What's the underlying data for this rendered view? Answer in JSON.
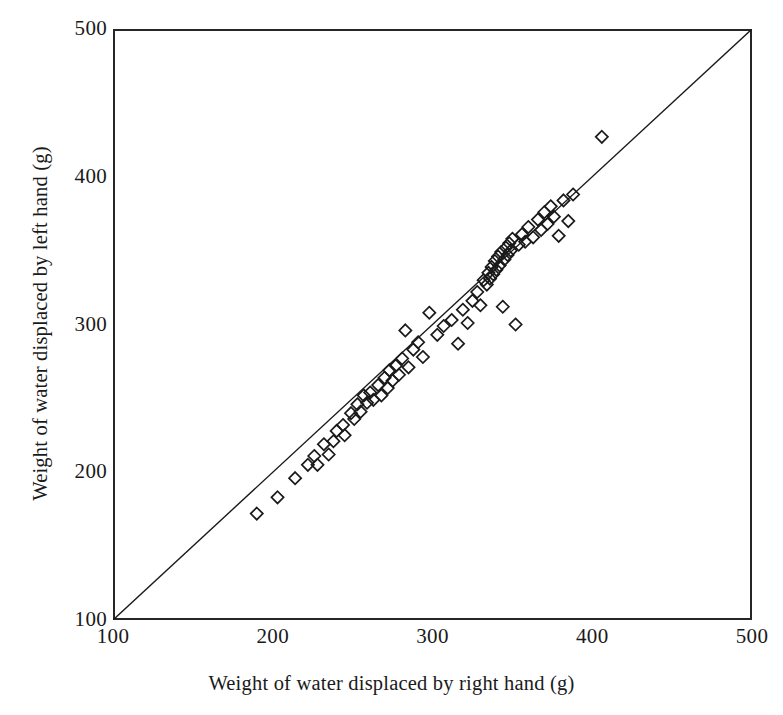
{
  "figure": {
    "background_color": "#ffffff",
    "ink_color": "#1a1a1a",
    "frame_color": "#262626"
  },
  "axes": {
    "x_title": "Weight of water displaced by right hand (g)",
    "y_title": "Weight of water displaced by left hand (g)",
    "x_ticks": [
      "100",
      "200",
      "300",
      "400",
      "500"
    ],
    "y_ticks": [
      "100",
      "200",
      "300",
      "400",
      "500"
    ]
  },
  "chart_data": {
    "type": "scatter",
    "title": "",
    "xlabel": "Weight of water displaced by right hand (g)",
    "ylabel": "Weight of water displaced by left hand (g)",
    "xlim": [
      100,
      500
    ],
    "ylim": [
      100,
      500
    ],
    "xticks": [
      100,
      200,
      300,
      400,
      500
    ],
    "yticks": [
      100,
      200,
      300,
      400,
      500
    ],
    "grid": false,
    "legend": null,
    "marker": "open-diamond",
    "marker_size": 9,
    "reference_line": {
      "name": "line of equality (y = x)",
      "type": "line",
      "x": [
        100,
        500
      ],
      "y": [
        100,
        500
      ]
    },
    "series": [
      {
        "name": "subjects",
        "n": 78,
        "points": [
          [
            190,
            172
          ],
          [
            203,
            183
          ],
          [
            214,
            196
          ],
          [
            222,
            205
          ],
          [
            226,
            211
          ],
          [
            228,
            205
          ],
          [
            232,
            219
          ],
          [
            235,
            212
          ],
          [
            238,
            221
          ],
          [
            240,
            228
          ],
          [
            244,
            232
          ],
          [
            245,
            225
          ],
          [
            249,
            240
          ],
          [
            251,
            236
          ],
          [
            253,
            246
          ],
          [
            255,
            241
          ],
          [
            257,
            252
          ],
          [
            259,
            247
          ],
          [
            261,
            254
          ],
          [
            263,
            249
          ],
          [
            266,
            259
          ],
          [
            268,
            252
          ],
          [
            270,
            264
          ],
          [
            272,
            257
          ],
          [
            273,
            269
          ],
          [
            275,
            262
          ],
          [
            277,
            272
          ],
          [
            279,
            266
          ],
          [
            281,
            277
          ],
          [
            283,
            296
          ],
          [
            285,
            271
          ],
          [
            288,
            283
          ],
          [
            291,
            288
          ],
          [
            294,
            278
          ],
          [
            298,
            308
          ],
          [
            303,
            293
          ],
          [
            307,
            299
          ],
          [
            312,
            303
          ],
          [
            316,
            287
          ],
          [
            319,
            310
          ],
          [
            322,
            301
          ],
          [
            325,
            316
          ],
          [
            328,
            322
          ],
          [
            330,
            313
          ],
          [
            332,
            330
          ],
          [
            334,
            327
          ],
          [
            335,
            335
          ],
          [
            336,
            331
          ],
          [
            337,
            339
          ],
          [
            338,
            334
          ],
          [
            339,
            343
          ],
          [
            340,
            337
          ],
          [
            341,
            346
          ],
          [
            342,
            340
          ],
          [
            343,
            349
          ],
          [
            344,
            312
          ],
          [
            345,
            344
          ],
          [
            346,
            352
          ],
          [
            347,
            347
          ],
          [
            348,
            355
          ],
          [
            349,
            350
          ],
          [
            350,
            358
          ],
          [
            352,
            300
          ],
          [
            354,
            354
          ],
          [
            356,
            361
          ],
          [
            358,
            356
          ],
          [
            360,
            366
          ],
          [
            363,
            359
          ],
          [
            366,
            371
          ],
          [
            368,
            364
          ],
          [
            370,
            376
          ],
          [
            372,
            368
          ],
          [
            374,
            380
          ],
          [
            376,
            373
          ],
          [
            379,
            360
          ],
          [
            382,
            384
          ],
          [
            385,
            370
          ],
          [
            388,
            388
          ],
          [
            406,
            427
          ]
        ]
      }
    ]
  }
}
